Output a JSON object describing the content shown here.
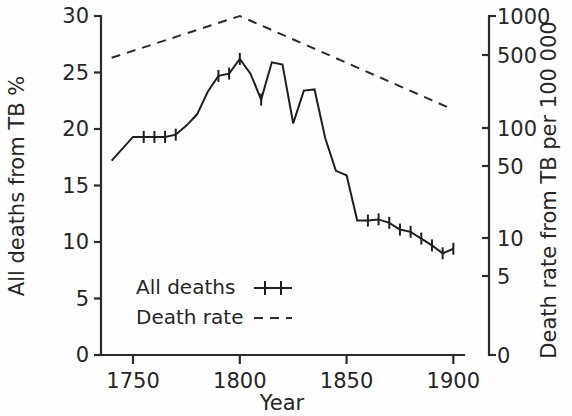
{
  "chart_data": {
    "type": "line",
    "title": "",
    "xlabel": "Year",
    "ylabel": "All deaths from TB %",
    "y2label": "Death rate from TB per 100 000",
    "xlim": [
      1735,
      1905
    ],
    "ylim": [
      0,
      30
    ],
    "y2lim": [
      0,
      1000
    ],
    "y2_scale": "log-like",
    "grid": false,
    "legend_position": "inside-lower-left",
    "xticks": [
      1750,
      1800,
      1850,
      1900
    ],
    "xtick_labels": [
      "1750",
      "1800",
      "1850",
      "1900"
    ],
    "yticks": [
      0,
      5,
      10,
      15,
      20,
      25,
      30
    ],
    "ytick_labels": [
      "0",
      "5",
      "10",
      "15",
      "20",
      "25",
      "30"
    ],
    "y2ticks": [
      0,
      5,
      10,
      50,
      100,
      500,
      1000
    ],
    "y2tick_labels": [
      "0",
      "5",
      "10",
      "50",
      "100",
      "500",
      "1000"
    ],
    "series": [
      {
        "name": "All deaths",
        "label": "All deaths",
        "style": "solid-with-tick-markers",
        "color": "#1f1f1f",
        "axis": "left",
        "unit": "%",
        "x": [
          1740,
          1750,
          1755,
          1760,
          1765,
          1770,
          1775,
          1780,
          1785,
          1790,
          1795,
          1800,
          1805,
          1810,
          1815,
          1820,
          1825,
          1830,
          1835,
          1840,
          1845,
          1850,
          1855,
          1860,
          1865,
          1870,
          1875,
          1880,
          1885,
          1890,
          1895,
          1900
        ],
        "values": [
          17.2,
          19.3,
          19.3,
          19.3,
          19.3,
          19.5,
          20.3,
          21.3,
          23.3,
          24.7,
          24.9,
          26.2,
          24.9,
          22.6,
          25.9,
          25.7,
          20.5,
          23.4,
          23.5,
          19.2,
          16.3,
          15.9,
          11.9,
          11.9,
          12.0,
          11.7,
          11.1,
          10.9,
          10.3,
          9.7,
          9.0,
          9.4
        ]
      },
      {
        "name": "Death rate",
        "label": "Death rate",
        "style": "dashed",
        "color": "#2b2b2b",
        "axis": "right",
        "unit": "per 100 000",
        "x": [
          1740,
          1800,
          1900
        ],
        "values": [
          470,
          1000,
          150
        ]
      }
    ],
    "legend": [
      {
        "label": "All deaths",
        "marker": "tick-line"
      },
      {
        "label": "Death rate",
        "marker": "dashed-line"
      }
    ]
  },
  "colors": {
    "axis": "#2b2b2b",
    "series_all_deaths": "#1f1f1f",
    "series_death_rate": "#2b2b2b",
    "background": "#ffffff",
    "text": "#262626"
  }
}
